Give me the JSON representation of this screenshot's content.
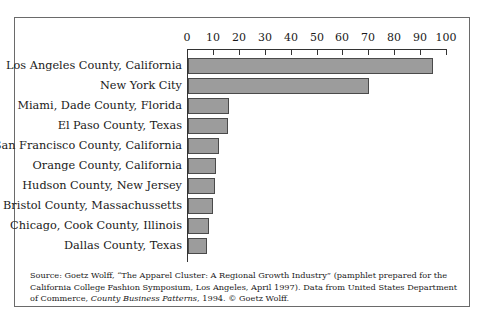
{
  "chart_data": {
    "type": "bar",
    "orientation": "horizontal",
    "title": "",
    "xlabel": "",
    "ylabel": "",
    "xlim": [
      0,
      100
    ],
    "x_ticks": [
      0,
      10,
      20,
      30,
      40,
      50,
      60,
      70,
      80,
      90,
      100
    ],
    "grid": false,
    "legend": null,
    "categories": [
      "Los Angeles County, California",
      "New York City",
      "Miami, Dade County, Florida",
      "El Paso County, Texas",
      "San Francisco County, California",
      "Orange County, California",
      "Hudson County, New Jersey",
      "Bristol County, Massachussetts",
      "Chicago, Cook County, Illinois",
      "Dallas County, Texas"
    ],
    "values": [
      94.5,
      70,
      16,
      15.5,
      12,
      11,
      10.5,
      9.5,
      8,
      7.5
    ],
    "bar_color": "#9c9c9c",
    "bar_edge_color": "#4a4a4a"
  },
  "axis": {
    "ticks": [
      "0",
      "10",
      "20",
      "30",
      "40",
      "50",
      "60",
      "70",
      "80",
      "90",
      "100"
    ]
  },
  "source": {
    "part1": "Source: Goetz Wolff, “The Apparel Cluster: A Regional Growth Industry” (pamphlet prepared for the California College Fashion Symposium, Los Angeles, April 1997). Data from United States Department of Commerce, ",
    "italic1": "County Business Patterns",
    "part2": ", 1994. © Goetz Wolff."
  }
}
